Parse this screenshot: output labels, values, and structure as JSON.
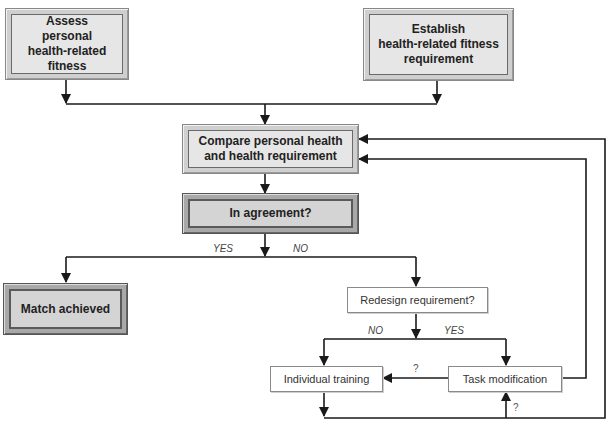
{
  "diagram": {
    "type": "flowchart",
    "nodes": {
      "assess": "Assess personal health-related fitness",
      "establish": "Establish health-related fitness requirement",
      "compare": "Compare personal health and health requirement",
      "agreement": "In agreement?",
      "match": "Match achieved",
      "redesign": "Redesign requirement?",
      "training": "Individual training",
      "task": "Task modification"
    },
    "node_lines": {
      "assess": [
        "Assess",
        "personal",
        "health-related",
        "fitness"
      ],
      "establish": [
        "Establish",
        "health-related fitness",
        "requirement"
      ],
      "compare": [
        "Compare personal health",
        "and health requirement"
      ]
    },
    "edge_labels": {
      "agreement_yes": "YES",
      "agreement_no": "NO",
      "redesign_no": "NO",
      "redesign_yes": "YES",
      "task_to_training": "?",
      "loop_to_task": "?"
    },
    "edges": [
      {
        "from": "assess",
        "to": "compare"
      },
      {
        "from": "establish",
        "to": "compare"
      },
      {
        "from": "compare",
        "to": "agreement"
      },
      {
        "from": "agreement",
        "to": "match",
        "label": "YES"
      },
      {
        "from": "agreement",
        "to": "redesign",
        "label": "NO"
      },
      {
        "from": "redesign",
        "to": "training",
        "label": "NO"
      },
      {
        "from": "redesign",
        "to": "task",
        "label": "YES"
      },
      {
        "from": "task",
        "to": "training",
        "label": "?"
      },
      {
        "from": "task",
        "to": "compare"
      },
      {
        "from": "training",
        "to": "compare"
      },
      {
        "from": "training",
        "to": "task",
        "label": "?"
      }
    ],
    "colors": {
      "line": "#1a1a1a",
      "box_fill": "#e6e6e6",
      "box_frame": "#cfcfcf",
      "plain_box_fill": "#ffffff"
    }
  }
}
